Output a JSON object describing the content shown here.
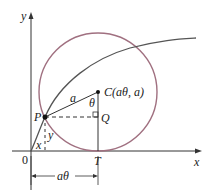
{
  "figure": {
    "type": "cycloid-construction",
    "labels": {
      "y_axis": "y",
      "x_axis": "x",
      "origin": "0",
      "point_P": "P",
      "point_Q": "Q",
      "point_T": "T",
      "point_C": "C(aθ, a)",
      "radius": "a",
      "angle": "θ",
      "seg_x": "x",
      "seg_y": "y",
      "arc_length": "aθ"
    },
    "colors": {
      "axes": "#333333",
      "circle": "#a07080",
      "curve": "#555555",
      "lines": "#333333"
    }
  }
}
